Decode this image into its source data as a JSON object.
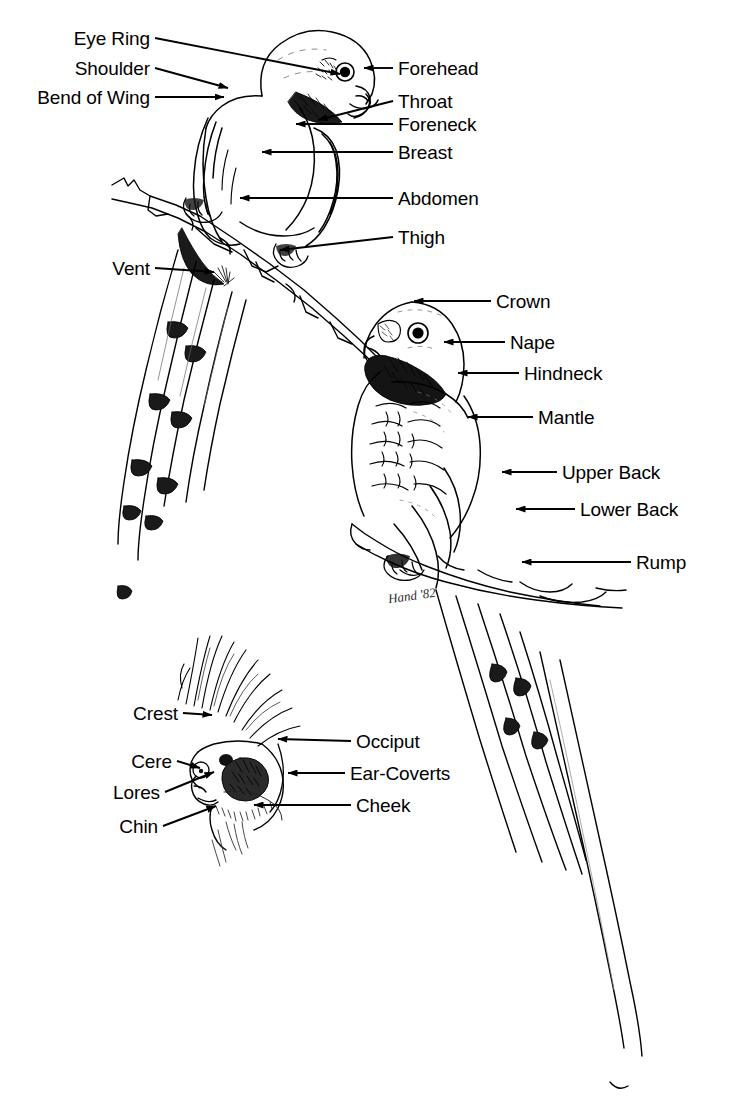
{
  "diagram": {
    "signature": "Hand '82",
    "background_color": "#ffffff",
    "ink_color": "#000000"
  },
  "figures": [
    {
      "id": "perched-bird-front",
      "name": "front-view-parakeet-on-branch",
      "labels_left": [
        {
          "text": "Eye Ring",
          "tx": 150,
          "ty": 38,
          "ax": 340,
          "ay": 74
        },
        {
          "text": "Shoulder",
          "tx": 150,
          "ty": 68,
          "ax": 228,
          "ay": 88
        },
        {
          "text": "Bend of Wing",
          "tx": 150,
          "ty": 97,
          "ax": 224,
          "ay": 97
        },
        {
          "text": "Vent",
          "tx": 150,
          "ty": 268,
          "ax": 214,
          "ay": 272
        }
      ],
      "labels_right": [
        {
          "text": "Forehead",
          "tx": 398,
          "ty": 68,
          "ax": 364,
          "ay": 68
        },
        {
          "text": "Throat",
          "tx": 398,
          "ty": 101,
          "ax": 318,
          "ay": 120
        },
        {
          "text": "Foreneck",
          "tx": 398,
          "ty": 124,
          "ax": 296,
          "ay": 124
        },
        {
          "text": "Breast",
          "tx": 398,
          "ty": 152,
          "ax": 262,
          "ay": 152
        },
        {
          "text": "Abdomen",
          "tx": 398,
          "ty": 198,
          "ax": 240,
          "ay": 198
        },
        {
          "text": "Thigh",
          "tx": 398,
          "ty": 237,
          "ax": 280,
          "ay": 250
        }
      ]
    },
    {
      "id": "perched-bird-back",
      "name": "back-view-parakeet-on-branch",
      "labels_right": [
        {
          "text": "Crown",
          "tx": 496,
          "ty": 301,
          "ax": 414,
          "ay": 301
        },
        {
          "text": "Nape",
          "tx": 510,
          "ty": 342,
          "ax": 444,
          "ay": 342
        },
        {
          "text": "Hindneck",
          "tx": 524,
          "ty": 373,
          "ax": 458,
          "ay": 373
        },
        {
          "text": "Mantle",
          "tx": 538,
          "ty": 417,
          "ax": 468,
          "ay": 417
        },
        {
          "text": "Upper Back",
          "tx": 562,
          "ty": 472,
          "ax": 502,
          "ay": 472
        },
        {
          "text": "Lower Back",
          "tx": 580,
          "ty": 509,
          "ax": 516,
          "ay": 509
        },
        {
          "text": "Rump",
          "tx": 636,
          "ty": 562,
          "ax": 522,
          "ay": 562
        }
      ]
    },
    {
      "id": "head-detail",
      "name": "cockatiel-head-detail",
      "labels_left": [
        {
          "text": "Crest",
          "tx": 178,
          "ty": 713,
          "ax": 212,
          "ay": 715
        },
        {
          "text": "Cere",
          "tx": 172,
          "ty": 761,
          "ax": 200,
          "ay": 768
        },
        {
          "text": "Lores",
          "tx": 160,
          "ty": 792,
          "ax": 214,
          "ay": 772
        },
        {
          "text": "Chin",
          "tx": 158,
          "ty": 826,
          "ax": 216,
          "ay": 806
        }
      ],
      "labels_right": [
        {
          "text": "Occiput",
          "tx": 356,
          "ty": 741,
          "ax": 278,
          "ay": 739
        },
        {
          "text": "Ear-Coverts",
          "tx": 350,
          "ty": 773,
          "ax": 288,
          "ay": 773
        },
        {
          "text": "Cheek",
          "tx": 356,
          "ty": 805,
          "ax": 254,
          "ay": 805
        }
      ]
    }
  ]
}
